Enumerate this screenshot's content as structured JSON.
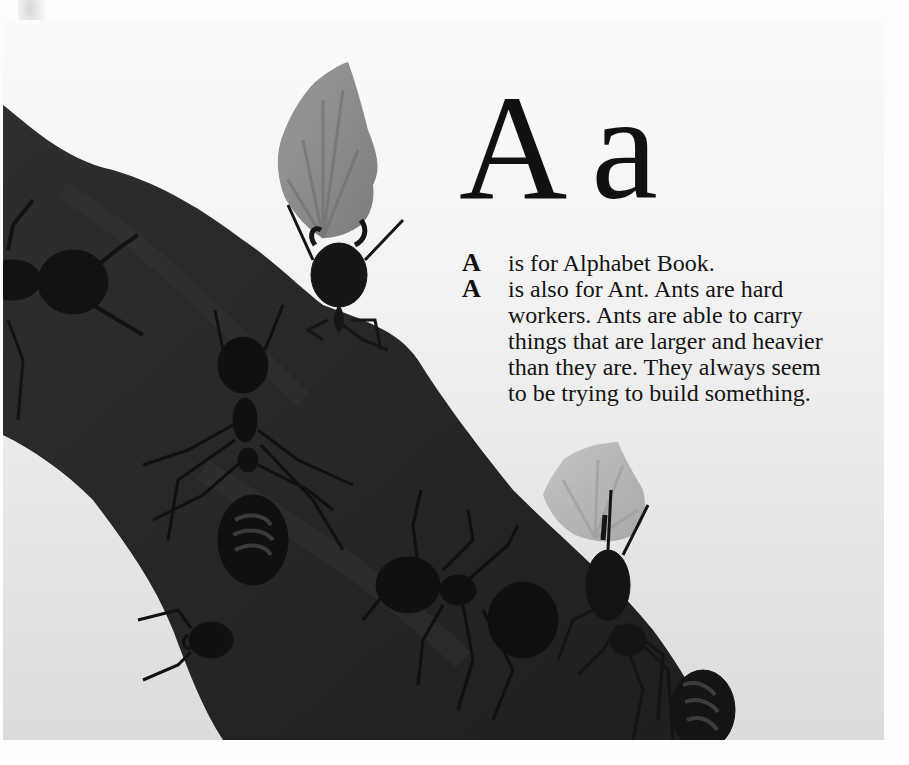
{
  "page": {
    "heading": {
      "upper": "A",
      "lower": "a"
    },
    "paragraphs": [
      {
        "drop_letter": "A",
        "lines": [
          "is for Alphabet Book."
        ]
      },
      {
        "drop_letter": "A",
        "lines": [
          "is also for Ant. Ants are hard",
          "workers. Ants are able to carry",
          "things that are larger and heavier",
          "than they are. They always seem",
          "to be trying to build something."
        ]
      }
    ]
  },
  "illustration": {
    "subject": "ants climbing a tree branch, two carrying leaf fragments",
    "palette": {
      "background_top": "#fbfbfb",
      "background_bottom": "#dcdcdc",
      "branch": "#2a2a2a",
      "ant": "#151515",
      "leaf": "#8a8a8a",
      "leaf_light": "#b9b9b9"
    }
  }
}
